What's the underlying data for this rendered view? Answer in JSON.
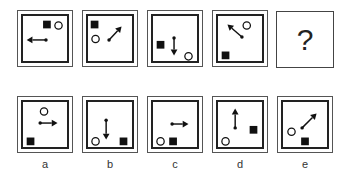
{
  "sequence": {
    "question_label": "?",
    "panels": [
      {
        "id": "s1",
        "square": [
          26,
          10
        ],
        "circle": [
          38,
          11
        ],
        "arrow": {
          "from": [
            29,
            30
          ],
          "to": [
            9,
            30
          ]
        }
      },
      {
        "id": "s2",
        "square": [
          8,
          10
        ],
        "circle": [
          9,
          25
        ],
        "arrow": {
          "from": [
            27,
            30
          ],
          "to": [
            40,
            16
          ]
        }
      },
      {
        "id": "s3",
        "square": [
          9,
          31
        ],
        "circle": [
          38,
          43
        ],
        "arrow": {
          "from": [
            27,
            28
          ],
          "to": [
            27,
            46
          ]
        }
      },
      {
        "id": "s4",
        "square": [
          9,
          42
        ],
        "circle": [
          31,
          11
        ],
        "arrow": {
          "from": [
            30,
            27
          ],
          "to": [
            15,
            14
          ]
        }
      }
    ]
  },
  "options": [
    {
      "label": "a",
      "square": [
        9,
        42
      ],
      "circle": [
        23,
        11
      ],
      "arrow": {
        "from": [
          23,
          27
        ],
        "to": [
          41,
          27
        ]
      }
    },
    {
      "label": "b",
      "square": [
        38,
        42
      ],
      "circle": [
        9,
        42
      ],
      "arrow": {
        "from": [
          24,
          24
        ],
        "to": [
          24,
          44
        ]
      }
    },
    {
      "label": "c",
      "square": [
        22,
        42
      ],
      "circle": [
        9,
        42
      ],
      "arrow": {
        "from": [
          25,
          28
        ],
        "to": [
          42,
          28
        ]
      }
    },
    {
      "label": "d",
      "square": [
        38,
        30
      ],
      "circle": [
        9,
        42
      ],
      "arrow": {
        "from": [
          23,
          32
        ],
        "to": [
          23,
          12
        ]
      }
    },
    {
      "label": "e",
      "square": [
        24,
        42
      ],
      "circle": [
        10,
        32
      ],
      "arrow": {
        "from": [
          25,
          32
        ],
        "to": [
          40,
          17
        ]
      }
    }
  ],
  "colors": {
    "shape": "#111111",
    "border": "#222222"
  }
}
